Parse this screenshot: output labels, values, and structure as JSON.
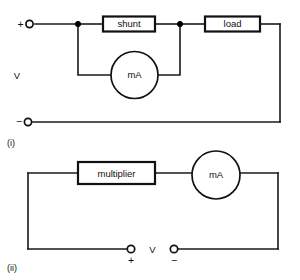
{
  "figure": {
    "background_color": "#ffffff",
    "line_color": "#1a1a1a"
  },
  "circuit_i": {
    "caption": "(i)",
    "supply_label": "V",
    "positive_terminal_label": "+",
    "negative_terminal_label": "−",
    "components": [
      {
        "kind": "box",
        "label": "shunt"
      },
      {
        "kind": "box",
        "label": "load"
      },
      {
        "kind": "meter",
        "label": "mA"
      }
    ],
    "shunt_label": "shunt",
    "load_label": "load",
    "meter_label": "mA"
  },
  "circuit_ii": {
    "caption": "(ii)",
    "supply_label": "V",
    "positive_terminal_label": "+",
    "negative_terminal_label": "−",
    "components": [
      {
        "kind": "box",
        "label": "multiplier"
      },
      {
        "kind": "meter",
        "label": "mA"
      }
    ],
    "multiplier_label": "multiplier",
    "meter_label": "mA"
  }
}
